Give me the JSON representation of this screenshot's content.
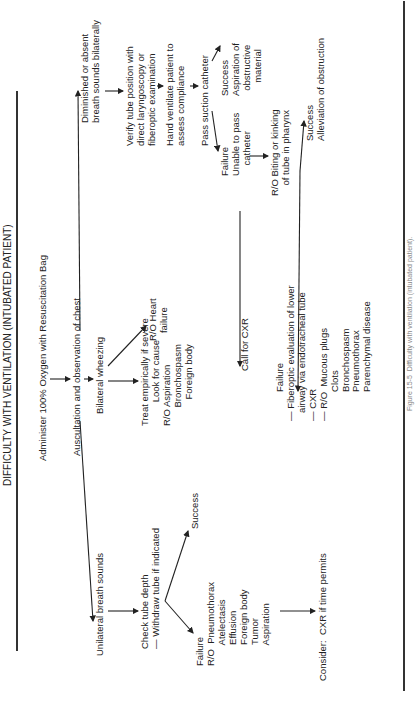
{
  "title": "DIFFICULTY WITH VENTILATION (INTUBATED PATIENT)",
  "nodes": {
    "start": "Administer 100% Oxygen with Resuscitation Bag",
    "auscultation": "Auscultation and observation of chest",
    "unilateral": "Unilateral breath sounds",
    "bilateral_wheezing": "Bilateral wheezing",
    "diminished": "Diminished or absent\nbreath sounds bilaterally",
    "check_tube": "Check tube depth\n— Withdraw tube if indicated",
    "check_success": "Success",
    "check_failure": "Failure\nR/O  Pneumothorax\n        Atelectasis\n        Effusion\n        Foreign body\n        Tumor\n        Aspiration",
    "consider": "Consider:  CXR if time permits",
    "rohf": "R/O Heart\n   failure",
    "treat": "Treat empirically if severe\n         Look for cause\nR/O Aspiration\n       Bronchospasm\n          Foreign body",
    "verify": "Verify tube position with\ndirect laryngoscopy or\nfiberoptic examination",
    "hand_ventilate": "Hand ventilate patient to\nassess compliance",
    "pass_suction": "Pass suction catheter",
    "suction_success": "Success\nAspiration of\n  obstructive\n     material",
    "suction_failure": "Failure\nUnable to pass\n    catheter",
    "call_cxr": "Call for CXR",
    "ro_biting": "R/O Biting or kinking\n    of tube in pharynx",
    "biting_success": "Success\nAlleviation of obstruction",
    "final_failure": "           Failure\n— Fiberoptic evaluation of lower\n   airway via endotracheal tube\n— CXR\n— R/O  Mucous plugs\n           Clots\n           Bronchospasm\n           Pneumothorax\n           Parenchymal disease"
  },
  "caption": "Figure 15-5  Difficulty with ventilation (intubated patient)."
}
